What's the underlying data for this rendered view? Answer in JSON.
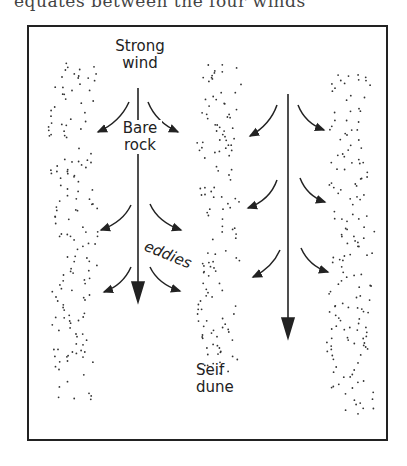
{
  "cropped_text": "equates between the four winds",
  "diagram": {
    "labels": {
      "strong_wind": "Strong",
      "strong_wind_2": "wind",
      "bare_rock": "Bare",
      "bare_rock_2": "rock",
      "eddies": "eddies",
      "seif_dune": "Seif",
      "seif_dune_2": "dune"
    },
    "elements": [
      "left-dune-stipple",
      "middle-dune-stipple",
      "right-dune-stipple",
      "wind-arrow-left",
      "wind-arrow-right",
      "eddy-arrows"
    ]
  }
}
